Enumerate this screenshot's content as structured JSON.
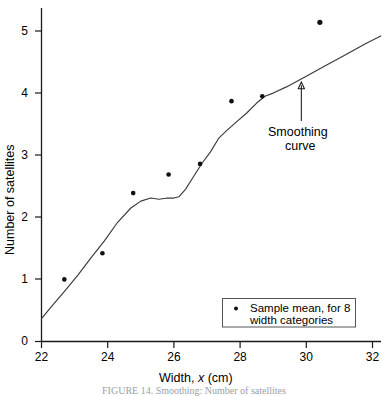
{
  "chart_data": {
    "type": "scatter",
    "title": "",
    "subtitle": "",
    "xlabel": "Width, x (cm)",
    "xlabel_parts": {
      "pre": "Width, ",
      "italic": "x",
      "post": " (cm)"
    },
    "ylabel": "Number of satellites",
    "xlim": [
      22,
      32.3
    ],
    "ylim": [
      0,
      5.45
    ],
    "grid": false,
    "x_ticks": [
      22,
      24,
      26,
      28,
      30,
      32
    ],
    "x_tick_labels": [
      "22",
      "24",
      "26",
      "28",
      "30",
      "32"
    ],
    "y_ticks": [
      0,
      1,
      2,
      3,
      4,
      5
    ],
    "y_tick_labels": [
      "0",
      "1",
      "2",
      "3",
      "4",
      "5"
    ],
    "legend_position": "lower right",
    "series": [
      {
        "name": "Sample mean, for 8 width categories",
        "type": "scatter",
        "marker": "dot",
        "color": "#101010",
        "x": [
          22.69,
          23.84,
          24.77,
          25.84,
          26.79,
          27.74,
          28.67,
          30.41
        ],
        "y": [
          1.0,
          1.42,
          2.39,
          2.69,
          2.86,
          3.87,
          3.95,
          5.14
        ]
      },
      {
        "name": "Smoothing curve",
        "type": "line",
        "color": "#3a3a3a",
        "x": [
          22.0,
          22.3,
          22.7,
          23.1,
          23.5,
          23.9,
          24.3,
          24.7,
          25.0,
          25.3,
          25.55,
          25.8,
          26.0,
          26.15,
          26.35,
          26.6,
          26.85,
          27.1,
          27.35,
          27.6,
          27.9,
          28.2,
          28.5,
          28.75,
          29.0,
          29.4,
          30.0,
          30.6,
          31.2,
          31.8,
          32.25
        ],
        "y": [
          0.37,
          0.56,
          0.81,
          1.07,
          1.35,
          1.62,
          1.92,
          2.15,
          2.26,
          2.31,
          2.29,
          2.31,
          2.31,
          2.33,
          2.45,
          2.66,
          2.87,
          3.05,
          3.27,
          3.4,
          3.54,
          3.68,
          3.84,
          3.95,
          4.0,
          4.1,
          4.27,
          4.45,
          4.62,
          4.8,
          4.92
        ]
      }
    ],
    "annotations": [
      {
        "name": "smoothing-curve-annotation",
        "text_line1": "Smoothing",
        "text_line2": "curve",
        "arrow_from_x": 29.85,
        "arrow_from_y": 3.55,
        "arrow_to_x": 29.85,
        "arrow_to_y": 4.18
      }
    ],
    "legend": {
      "marker_symbol": "dot",
      "line1": "Sample mean,  for 8",
      "line2": "width categories"
    }
  },
  "figure": {
    "caption": "FIGURE 14. Smoothing: Number of satellites"
  },
  "colors": {
    "axis": "#1a1a1a",
    "curve": "#3a3a3a",
    "point": "#101010",
    "legend_border": "#555555",
    "background": "#ffffff"
  }
}
